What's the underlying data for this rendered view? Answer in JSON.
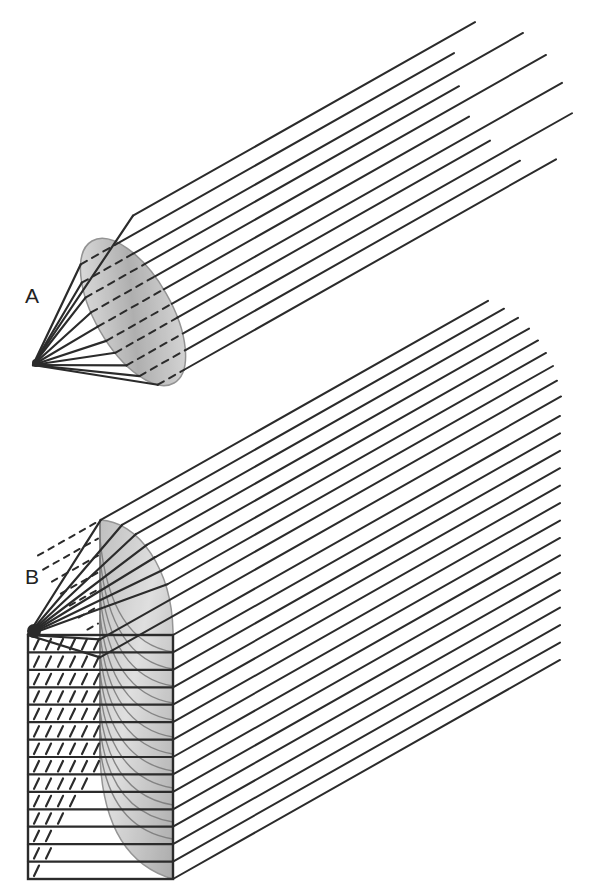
{
  "figure": {
    "background": "#ffffff",
    "line_color": "#2b2b2b",
    "ray_slope": -0.566,
    "panels": [
      {
        "id": "A",
        "label": "A",
        "label_pos": [
          25,
          288
        ],
        "description": "Point source fanning rays onto a tilted circular disc, emerging as parallel rays",
        "apex": [
          33,
          365
        ],
        "disc": {
          "cx": 133,
          "cy": 312,
          "rx": 38,
          "ry": 82,
          "rotate": -30
        },
        "ray_offsets": [
          291,
          310,
          329,
          346,
          364,
          382,
          401,
          418,
          437,
          455,
          474
        ],
        "ray_end_x": [
          475,
          454,
          523,
          459,
          546,
          469,
          562,
          490,
          572,
          520,
          556
        ]
      },
      {
        "id": "B",
        "label": "B",
        "label_pos": [
          25,
          568
        ],
        "description": "Point source fanning rays onto a quarter-disc plus a stack of parallel horizontal rows, all emerging as parallel rays",
        "apex": [
          28,
          635
        ],
        "quarter": {
          "cx": 100,
          "cy": 635,
          "rx": 75,
          "ry": 115
        },
        "fan_offsets": [
          577,
          594,
          611,
          628,
          645,
          662,
          679,
          696,
          714
        ],
        "fan_end_x": [
          488,
          504,
          518,
          529,
          538,
          546,
          553,
          557,
          561
        ],
        "rect": {
          "x": 28,
          "y": 635,
          "right": 173,
          "bottom": 879,
          "row_count": 14,
          "row_end_x": 560
        }
      }
    ]
  }
}
